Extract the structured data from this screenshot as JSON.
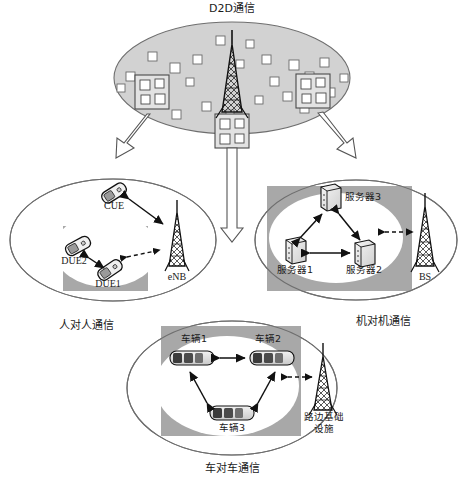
{
  "diagram": {
    "title": "D2D通信",
    "title_en_meaning": "D2D Communication"
  },
  "top_cell": {
    "name": "macro-cell-ellipse",
    "tower_label": "",
    "building_boxes": 3,
    "scatter_squares": 24,
    "fill_color": "#d2d2d2",
    "stroke_color": "#6e6e6e"
  },
  "branches": [
    {
      "id": "h2h",
      "caption": "人对人通信",
      "nodes": [
        {
          "id": "cue",
          "label": "CUE",
          "icon": "mobile-phone-icon"
        },
        {
          "id": "due2",
          "label": "DUE2",
          "icon": "mobile-phone-icon"
        },
        {
          "id": "due1",
          "label": "DUE1",
          "icon": "mobile-phone-icon"
        },
        {
          "id": "enb",
          "label": "eNB",
          "icon": "cell-tower-icon"
        }
      ],
      "links": [
        {
          "from": "cue",
          "to": "enb",
          "style": "solid"
        },
        {
          "from": "due2",
          "to": "due1",
          "style": "solid"
        },
        {
          "from": "due1",
          "to": "enb",
          "style": "dashed"
        }
      ]
    },
    {
      "id": "m2m",
      "caption": "机对机通信",
      "nodes": [
        {
          "id": "server3",
          "label": "服务器3",
          "icon": "server-icon"
        },
        {
          "id": "server1",
          "label": "服务器1",
          "icon": "server-icon"
        },
        {
          "id": "server2",
          "label": "服务器2",
          "icon": "server-icon"
        },
        {
          "id": "bs",
          "label": "BS",
          "icon": "cell-tower-icon"
        }
      ],
      "links": [
        {
          "from": "server1",
          "to": "server3",
          "style": "solid"
        },
        {
          "from": "server3",
          "to": "server2",
          "style": "solid"
        },
        {
          "from": "server1",
          "to": "server2",
          "style": "solid"
        },
        {
          "from": "server2",
          "to": "bs",
          "style": "dashed"
        }
      ]
    },
    {
      "id": "v2v",
      "caption": "车对车通信",
      "nodes": [
        {
          "id": "car1",
          "label": "车辆1",
          "icon": "car-icon"
        },
        {
          "id": "car2",
          "label": "车辆2",
          "icon": "car-icon"
        },
        {
          "id": "car3",
          "label": "车辆3",
          "icon": "car-icon"
        },
        {
          "id": "rsu",
          "label_line1": "路边基础",
          "label_line2": "设施",
          "icon": "cell-tower-icon"
        }
      ],
      "links": [
        {
          "from": "car1",
          "to": "car2",
          "style": "solid"
        },
        {
          "from": "car1",
          "to": "car3",
          "style": "solid"
        },
        {
          "from": "car2",
          "to": "car3",
          "style": "solid"
        },
        {
          "from": "car2",
          "to": "rsu",
          "style": "dashed"
        }
      ]
    }
  ],
  "colors": {
    "cell_fill": "#d2d2d2",
    "band_fill": "#a8a8a8",
    "inner_ellipse": "#ffffff",
    "outline": "#5a5a5a",
    "ink": "#111111"
  }
}
